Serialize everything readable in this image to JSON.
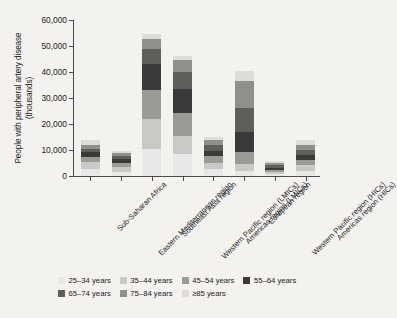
{
  "chart_data": {
    "type": "bar",
    "stacked": true,
    "title": "",
    "xlabel": "",
    "ylabel": "People with peripheral artery disease (thousands)",
    "ylim": [
      0,
      60000
    ],
    "ytick_values": [
      0,
      10000,
      20000,
      30000,
      40000,
      50000,
      60000
    ],
    "ytick_labels": [
      "0",
      "10,000",
      "20,000",
      "30,000",
      "40,000",
      "50,000",
      "60,000"
    ],
    "grid": false,
    "legend_position": "bottom",
    "categories": [
      "Sub-Saharan Africa",
      "Eastern Mediterranean region",
      "Southeast Asia region",
      "Western Pacific region (LMICs)",
      "Americas region (LMICs)",
      "European region",
      "Western Pacific region (HICs)",
      "Americas region (HICs)"
    ],
    "series": [
      {
        "name": "25–34 years",
        "color": "#e8e8e6",
        "values": [
          2700,
          1700,
          10300,
          8400,
          2600,
          2000,
          800,
          2000
        ]
      },
      {
        "name": "35–44 years",
        "color": "#c9c9c6",
        "values": [
          2600,
          1700,
          11600,
          6900,
          2500,
          2800,
          700,
          2200
        ]
      },
      {
        "name": "45–54 years",
        "color": "#9a9a97",
        "values": [
          2200,
          1700,
          11100,
          9000,
          2500,
          4500,
          800,
          2000
        ]
      },
      {
        "name": "55–64 years",
        "color": "#3a3a38",
        "values": [
          1600,
          1500,
          9900,
          9200,
          2000,
          7500,
          900,
          1800
        ]
      },
      {
        "name": "65–74 years",
        "color": "#5e5e5b",
        "values": [
          1300,
          1200,
          5800,
          6500,
          2300,
          9300,
          1000,
          1900
        ]
      },
      {
        "name": "75–84 years",
        "color": "#8f8f8c",
        "values": [
          1600,
          1000,
          4000,
          4500,
          2000,
          10600,
          900,
          2100
        ]
      },
      {
        "name": "≥85 years",
        "color": "#dcdcd9",
        "values": [
          1700,
          700,
          1800,
          1500,
          1200,
          3800,
          500,
          1700
        ]
      }
    ],
    "totals": [
      13700,
      9500,
      54500,
      46000,
      15100,
      40500,
      5600,
      13700
    ]
  },
  "legend": {
    "items": [
      {
        "label": "25–34 years",
        "color": "#e8e8e6"
      },
      {
        "label": "35–44 years",
        "color": "#c9c9c6"
      },
      {
        "label": "45–54 years",
        "color": "#9a9a97"
      },
      {
        "label": "55–64 years",
        "color": "#3a3a38"
      },
      {
        "label": "65–74 years",
        "color": "#5e5e5b"
      },
      {
        "label": "75–84 years",
        "color": "#8f8f8c"
      },
      {
        "label": "≥85 years",
        "color": "#dcdcd9"
      }
    ]
  },
  "style": {
    "background": "#f3f2ef",
    "axis_color": "#4b4b4b",
    "text_color": "#1c1c1c"
  }
}
